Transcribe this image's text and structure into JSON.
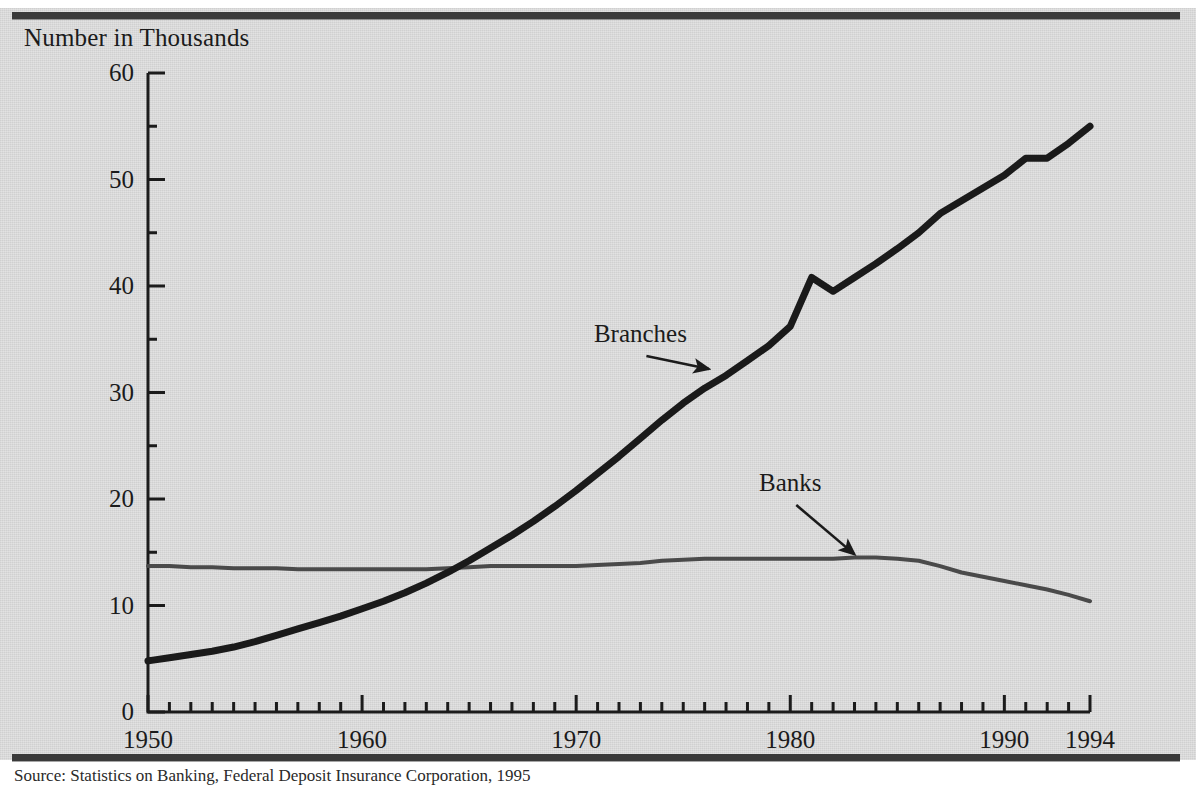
{
  "figure": {
    "axis_title": "Number in Thousands",
    "source_note": "Source: Statistics on Banking, Federal Deposit Insurance Corporation, 1995",
    "colors": {
      "plate": "#d9d9d9",
      "rule": "#3a3a3a",
      "branches_line": "#1a1a1a",
      "banks_line": "#4a4a4a",
      "text": "#1b1b1b"
    }
  },
  "chart_data": {
    "type": "line",
    "title": "Number in Thousands",
    "xlabel": "",
    "ylabel": "Number in Thousands",
    "xlim": [
      1950,
      1994
    ],
    "ylim": [
      0,
      60
    ],
    "ytick_labels": [
      "0",
      "10",
      "20",
      "30",
      "40",
      "50",
      "60"
    ],
    "ytick_values": [
      0,
      10,
      20,
      30,
      40,
      50,
      60
    ],
    "yminor_step": 5,
    "xtick_labels": [
      "1950",
      "1960",
      "1970",
      "1980",
      "1990",
      "1994"
    ],
    "xtick_values": [
      1950,
      1960,
      1970,
      1980,
      1990,
      1994
    ],
    "xminor_step": 1,
    "grid": false,
    "legend": "annotations",
    "annotations": [
      {
        "text": "Branches",
        "x": 1973.0,
        "y": 35.5,
        "arrow_to_x": 1976.2,
        "arrow_to_y": 32.2
      },
      {
        "text": "Banks",
        "x": 1980.0,
        "y": 21.5,
        "arrow_to_x": 1983.0,
        "arrow_to_y": 14.8
      }
    ],
    "x": [
      1950,
      1951,
      1952,
      1953,
      1954,
      1955,
      1956,
      1957,
      1958,
      1959,
      1960,
      1961,
      1962,
      1963,
      1964,
      1965,
      1966,
      1967,
      1968,
      1969,
      1970,
      1971,
      1972,
      1973,
      1974,
      1975,
      1976,
      1977,
      1978,
      1979,
      1980,
      1981,
      1982,
      1983,
      1984,
      1985,
      1986,
      1987,
      1988,
      1989,
      1990,
      1991,
      1992,
      1993,
      1994
    ],
    "series": [
      {
        "name": "Branches",
        "values": [
          4.8,
          5.1,
          5.4,
          5.7,
          6.1,
          6.6,
          7.2,
          7.8,
          8.4,
          9.0,
          9.7,
          10.4,
          11.2,
          12.1,
          13.1,
          14.2,
          15.4,
          16.6,
          17.9,
          19.3,
          20.8,
          22.4,
          24.0,
          25.7,
          27.4,
          29.0,
          30.4,
          31.6,
          33.0,
          34.4,
          36.2,
          40.8,
          39.5,
          40.8,
          42.1,
          43.5,
          45.0,
          46.8,
          48.0,
          49.2,
          50.4,
          52.0,
          52.0,
          53.4,
          55.0
        ]
      },
      {
        "name": "Banks",
        "values": [
          13.7,
          13.7,
          13.6,
          13.6,
          13.5,
          13.5,
          13.5,
          13.4,
          13.4,
          13.4,
          13.4,
          13.4,
          13.4,
          13.4,
          13.5,
          13.6,
          13.7,
          13.7,
          13.7,
          13.7,
          13.7,
          13.8,
          13.9,
          14.0,
          14.2,
          14.3,
          14.4,
          14.4,
          14.4,
          14.4,
          14.4,
          14.4,
          14.4,
          14.5,
          14.5,
          14.4,
          14.2,
          13.7,
          13.1,
          12.7,
          12.3,
          11.9,
          11.5,
          11.0,
          10.4
        ]
      }
    ]
  },
  "axes_geometry": {
    "left_px": 148,
    "right_px": 1090,
    "top_px": 73,
    "bottom_px": 712
  }
}
